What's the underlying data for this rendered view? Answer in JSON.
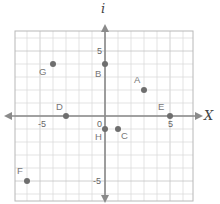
{
  "chart_data": {
    "type": "scatter",
    "title": "",
    "xlabel": "X",
    "ylabel": "i",
    "xlim": [
      -7,
      7
    ],
    "ylim": [
      -6.5,
      6.5
    ],
    "grid": true,
    "x_ticks": [
      {
        "value": -5,
        "label": "-5"
      },
      {
        "value": 0,
        "label": "0"
      },
      {
        "value": 5,
        "label": "5"
      }
    ],
    "y_ticks": [
      {
        "value": 5,
        "label": "5"
      },
      {
        "value": -5,
        "label": "-5"
      }
    ],
    "points": [
      {
        "label": "A",
        "x": 3,
        "y": 2
      },
      {
        "label": "B",
        "x": 0,
        "y": 4
      },
      {
        "label": "C",
        "x": 1,
        "y": -1
      },
      {
        "label": "D",
        "x": -3,
        "y": 0
      },
      {
        "label": "E",
        "x": 5,
        "y": 0
      },
      {
        "label": "F",
        "x": -6,
        "y": -5
      },
      {
        "label": "G",
        "x": -4,
        "y": 4
      },
      {
        "label": "H",
        "x": 0,
        "y": -1
      }
    ]
  },
  "colors": {
    "grid_minor": "#dcdcdc",
    "grid_major": "#c4c4c4",
    "frame": "#b8b8b8",
    "axis": "#8a8a8a",
    "point": "#6e6e6e",
    "label": "#777777"
  }
}
